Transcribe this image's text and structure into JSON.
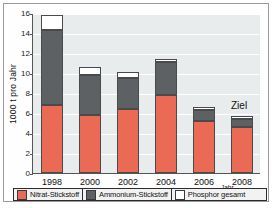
{
  "chart_data": {
    "type": "bar",
    "stacked": true,
    "title": "",
    "xlabel": "Jahr",
    "ylabel": "1000 t pro Jahr",
    "categories": [
      "1998",
      "2000",
      "2002",
      "2004",
      "2006",
      "2008"
    ],
    "ylim": [
      0,
      16
    ],
    "yticks": [
      0,
      2,
      4,
      6,
      8,
      10,
      12,
      14,
      16
    ],
    "grid": true,
    "legend_position": "bottom",
    "series": [
      {
        "name": "Nitrat-Stickstoff",
        "color": "#ea6a55",
        "values": [
          6.8,
          5.85,
          6.45,
          7.85,
          5.25,
          4.6
        ]
      },
      {
        "name": "Ammonium-Stickstoff",
        "color": "#5e6163",
        "values": [
          7.5,
          4.0,
          3.05,
          3.25,
          1.05,
          0.85
        ]
      },
      {
        "name": "Phosphor gesamt",
        "color": "#ffffff",
        "values": [
          1.55,
          0.75,
          0.6,
          0.3,
          0.35,
          0.25
        ]
      }
    ],
    "totals": [
      15.85,
      10.6,
      10.1,
      11.4,
      6.65,
      5.7
    ],
    "annotations": [
      {
        "text": "Ziel",
        "category": "2008"
      }
    ]
  },
  "legend": {
    "items": [
      {
        "label": "Nitrat-Stickstoff",
        "icon": "legend-swatch-red"
      },
      {
        "label": "Ammonium-Stickstoff",
        "icon": "legend-swatch-gray"
      },
      {
        "label": "Phosphor gesamt",
        "icon": "legend-swatch-white"
      }
    ]
  }
}
